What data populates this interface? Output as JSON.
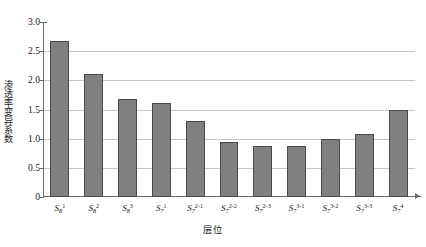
{
  "chart_data": {
    "type": "bar",
    "title": "",
    "xlabel": "层位",
    "ylabel": "渗透率变异系数",
    "ylim": [
      0,
      3.0
    ],
    "yticks": [
      "0",
      "0.5",
      "1.0",
      "1.5",
      "2.0",
      "2.5",
      "3.0"
    ],
    "ytick_values": [
      0,
      0.5,
      1.0,
      1.5,
      2.0,
      2.5,
      3.0
    ],
    "grid": "horizontal",
    "legend": "none",
    "bar_color": "#808080",
    "bar_edge_color": "#4a4a4a",
    "gridline_color": "#c8c8c8",
    "axis_color": "#6b6b6b",
    "categories": [
      "S8^1",
      "S8^2",
      "S8^3",
      "S7^1",
      "S7^2-1",
      "S7^2-2",
      "S7^2-3",
      "S7^3-1",
      "S7^3-2",
      "S7^3-3",
      "S7^4"
    ],
    "category_parts": [
      {
        "base": "S",
        "sub": "8",
        "sup": "1"
      },
      {
        "base": "S",
        "sub": "8",
        "sup": "2"
      },
      {
        "base": "S",
        "sub": "8",
        "sup": "3"
      },
      {
        "base": "S",
        "sub": "7",
        "sup": "1"
      },
      {
        "base": "S",
        "sub": "7",
        "sup": "2-1"
      },
      {
        "base": "S",
        "sub": "7",
        "sup": "2-2"
      },
      {
        "base": "S",
        "sub": "7",
        "sup": "2-3"
      },
      {
        "base": "S",
        "sub": "7",
        "sup": "3-1"
      },
      {
        "base": "S",
        "sub": "7",
        "sup": "3-2"
      },
      {
        "base": "S",
        "sub": "7",
        "sup": "3-3"
      },
      {
        "base": "S",
        "sub": "7",
        "sup": "4"
      }
    ],
    "values": [
      2.67,
      2.11,
      1.68,
      1.62,
      1.31,
      0.95,
      0.88,
      0.87,
      1.0,
      1.08,
      1.5
    ]
  }
}
